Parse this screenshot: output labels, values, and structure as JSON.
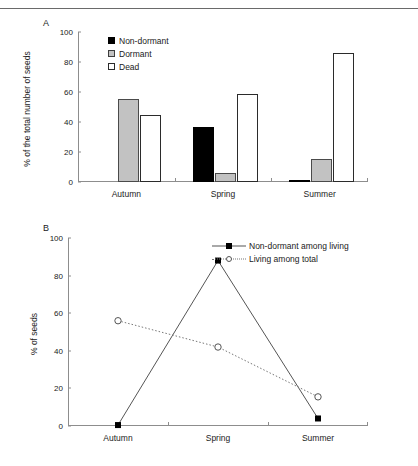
{
  "figure": {
    "panel_a_letter": "A",
    "panel_b_letter": "B"
  },
  "chart_data": [
    {
      "id": "panel_a",
      "type": "bar",
      "title": "",
      "xlabel": "",
      "ylabel": "% of the total number of seeds",
      "categories": [
        "Autumn",
        "Spring",
        "Summer"
      ],
      "ylim": [
        0,
        100
      ],
      "yticks": [
        0,
        20,
        40,
        60,
        80,
        100
      ],
      "grid": false,
      "legend_position": "top-left",
      "series": [
        {
          "name": "Non-dormant",
          "color": "#000000",
          "values": [
            0,
            37,
            1
          ]
        },
        {
          "name": "Dormant",
          "color": "#c2c2c2",
          "values": [
            55.5,
            6,
            15.5
          ]
        },
        {
          "name": "Dead",
          "color": "#ffffff",
          "values": [
            44.5,
            59,
            86
          ]
        }
      ]
    },
    {
      "id": "panel_b",
      "type": "line",
      "title": "",
      "xlabel": "",
      "ylabel": "% of seeds",
      "categories": [
        "Autumn",
        "Spring",
        "Summer"
      ],
      "ylim": [
        0,
        100
      ],
      "yticks": [
        0,
        20,
        40,
        60,
        80,
        100
      ],
      "grid": false,
      "legend_position": "top-right",
      "series": [
        {
          "name": "Non-dormant among living",
          "style": "solid",
          "marker": "filled-square",
          "color": "#555555",
          "values": [
            0.5,
            88,
            4
          ]
        },
        {
          "name": "Living among total",
          "style": "dotted",
          "marker": "open-circle",
          "color": "#777777",
          "values": [
            56,
            42,
            15.5
          ]
        }
      ]
    }
  ]
}
